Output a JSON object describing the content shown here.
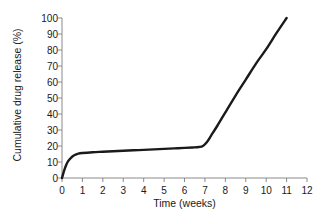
{
  "chart_data": {
    "type": "line",
    "title": "",
    "xlabel": "Time (weeks)",
    "ylabel": "Cumulative drug release (%)",
    "xlim": [
      0,
      12
    ],
    "ylim": [
      0,
      100
    ],
    "xticks": [
      0,
      1,
      2,
      3,
      4,
      5,
      6,
      7,
      8,
      9,
      10,
      11,
      12
    ],
    "xtick_labels": [
      "0",
      "1",
      "2",
      "3",
      "4",
      "5",
      "6",
      "7",
      "8",
      "9",
      "10",
      "11",
      "12"
    ],
    "yticks": [
      0,
      10,
      20,
      30,
      40,
      50,
      60,
      70,
      80,
      90,
      100
    ],
    "ytick_labels": [
      "0",
      "10",
      "20",
      "30",
      "40",
      "50",
      "60",
      "70",
      "80",
      "90",
      "100"
    ],
    "grid": false,
    "legend": false,
    "legend_position": "none",
    "line_color": "#1a1a1a",
    "line_width": 2.4,
    "axis_color": "#8a8a8a",
    "background_color": "#ffffff",
    "series": [
      {
        "name": "Cumulative drug release",
        "x": [
          0,
          0.1,
          0.2,
          0.3,
          0.45,
          0.6,
          0.8,
          1.0,
          1.5,
          2.0,
          2.5,
          3.0,
          3.5,
          4.0,
          4.5,
          5.0,
          5.5,
          6.0,
          6.4,
          6.7,
          6.9,
          7.1,
          7.3,
          7.6,
          8.0,
          8.5,
          9.0,
          9.5,
          10.0,
          10.5,
          11.0
        ],
        "y": [
          0,
          4.5,
          8.0,
          10.6,
          12.8,
          14.2,
          15.2,
          15.6,
          16.1,
          16.4,
          16.7,
          17.0,
          17.3,
          17.6,
          17.9,
          18.2,
          18.5,
          18.8,
          19.1,
          19.4,
          20.0,
          22.5,
          26.5,
          32.5,
          41.0,
          51.5,
          61.5,
          71.5,
          80.5,
          90.5,
          100.0
        ]
      }
    ]
  },
  "axes": {
    "x_origin_px": 62,
    "y_origin_px": 178,
    "x_scale_px_per_unit": 20.42,
    "y_scale_px_per_unit": 1.6
  }
}
